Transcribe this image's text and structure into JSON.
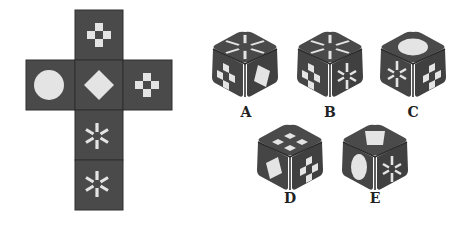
{
  "puzzle": {
    "type": "cube-net-folding",
    "net": {
      "faces": [
        {
          "position": "top",
          "symbol": "checker-cross"
        },
        {
          "position": "left",
          "symbol": "circle"
        },
        {
          "position": "center",
          "symbol": "diamond"
        },
        {
          "position": "right",
          "symbol": "checker-cross"
        },
        {
          "position": "below-center",
          "symbol": "asterisk"
        },
        {
          "position": "bottom",
          "symbol": "asterisk"
        }
      ]
    },
    "options": [
      {
        "label": "A",
        "top": "asterisk",
        "left": "checker",
        "right": "diamond"
      },
      {
        "label": "B",
        "top": "asterisk",
        "left": "checker",
        "right": "asterisk"
      },
      {
        "label": "C",
        "top": "circle",
        "left": "asterisk",
        "right": "checker"
      },
      {
        "label": "D",
        "top": "checker",
        "left": "diamond",
        "right": "checker"
      },
      {
        "label": "E",
        "top": "diamond",
        "left": "circle",
        "right": "asterisk"
      }
    ]
  },
  "colors": {
    "face": "#4a4a4a",
    "face_dark": "#3a3a3a",
    "symbol": "#e4e4e4",
    "edge": "#2e2e2e"
  }
}
